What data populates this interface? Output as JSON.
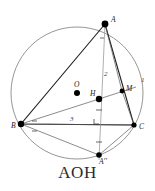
{
  "figure": {
    "caption": "AOH",
    "type": "euclidean-geometry-diagram",
    "colors": {
      "circle": "#8a8a8a",
      "triangle": "#1f1f1f",
      "thin_line": "#5a5a5a",
      "altitude": "#9a9a9a",
      "point": "#000000",
      "caption": "#2b2b2b"
    },
    "circle": {
      "cx": 77,
      "cy": 93,
      "r": 66
    },
    "points": [
      {
        "id": "A",
        "label": "A",
        "x": 105,
        "y": 24,
        "label_dx": 6,
        "label_dy": -2,
        "dot": true
      },
      {
        "id": "B",
        "label": "B",
        "x": 21,
        "y": 124,
        "label_dx": -8,
        "label_dy": 2,
        "dot": true
      },
      {
        "id": "C",
        "label": "C",
        "x": 134,
        "y": 125,
        "label_dx": 5,
        "label_dy": 3,
        "dot": true
      },
      {
        "id": "O",
        "label": "O",
        "x": 77,
        "y": 93,
        "label_dx": -1,
        "label_dy": -5,
        "dot": true
      },
      {
        "id": "H",
        "label": "H",
        "x": 99,
        "y": 99,
        "label_dx": -7,
        "label_dy": -3,
        "dot": true
      },
      {
        "id": "M",
        "label": "M",
        "x": 122,
        "y": 91,
        "label_dx": 4,
        "label_dy": -1,
        "dot": true
      },
      {
        "id": "A2",
        "label": "A''",
        "x": 99,
        "y": 155,
        "label_dx": 2,
        "label_dy": 7,
        "dot": true
      },
      {
        "id": "F",
        "label": "",
        "x": 99,
        "y": 124,
        "label_dx": 0,
        "label_dy": 0,
        "dot": false
      }
    ],
    "segment_labels": [
      {
        "id": "seg-2",
        "text": "2",
        "x": 104,
        "y": 76
      },
      {
        "id": "seg-1",
        "text": "1",
        "x": 141,
        "y": 82
      },
      {
        "id": "seg-3",
        "text": "3",
        "x": 70,
        "y": 121
      }
    ]
  }
}
